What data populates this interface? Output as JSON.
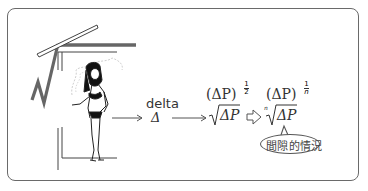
{
  "diagram": {
    "step1": {
      "word": "delta",
      "symbol": "Δ"
    },
    "step2": {
      "power_form": "(ΔP)",
      "exponent": "1/2",
      "exponent_num": "1",
      "exponent_den": "2",
      "root_form": "√ΔP",
      "radicand": "ΔP"
    },
    "step3": {
      "power_form": "(ΔP)",
      "exponent": "1/n",
      "exponent_num": "1",
      "exponent_den": "n",
      "root_index": "n",
      "radicand": "ΔP"
    },
    "callout": {
      "text": "間隙的情況"
    },
    "arrows": [
      "thin-arrow",
      "thin-arrow",
      "hollow-arrow"
    ],
    "illustration": "girl-standing-inside-large-square-root-symbol"
  }
}
